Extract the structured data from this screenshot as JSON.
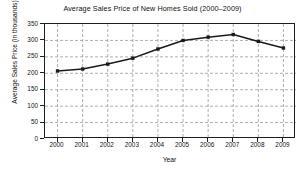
{
  "chart_data": {
    "type": "line",
    "title": "Average Sales Price of New Homes Sold (2000–2009)",
    "xlabel": "Year",
    "ylabel": "Average Sales Price (in thousands)",
    "categories": [
      "2000",
      "2001",
      "2002",
      "2003",
      "2004",
      "2005",
      "2006",
      "2007",
      "2008",
      "2009"
    ],
    "values": [
      207,
      213,
      228,
      246,
      274,
      300,
      310,
      318,
      297,
      277
    ],
    "series": [
      {
        "name": "Average Sales Price",
        "values": [
          207,
          213,
          228,
          246,
          274,
          300,
          310,
          318,
          297,
          277
        ]
      }
    ],
    "ylim": [
      0,
      350
    ],
    "ytick_values": [
      0,
      50,
      100,
      150,
      200,
      250,
      300,
      350
    ],
    "ytick_labels": [
      "0",
      "50",
      "100",
      "150",
      "200",
      "250",
      "300",
      "350"
    ],
    "xtick_labels": [
      "2000",
      "2001",
      "2002",
      "2003",
      "2004",
      "2005",
      "2006",
      "2007",
      "2008",
      "2009"
    ],
    "grid": true,
    "grid_style": "dashed",
    "grid_color": "#9a9a9a",
    "legend": "none",
    "line_color": "#1a1a1a",
    "marker": "square",
    "marker_color": "#1a1a1a",
    "background_color": "#ffffff",
    "axis_color": "#1f1f1f"
  }
}
